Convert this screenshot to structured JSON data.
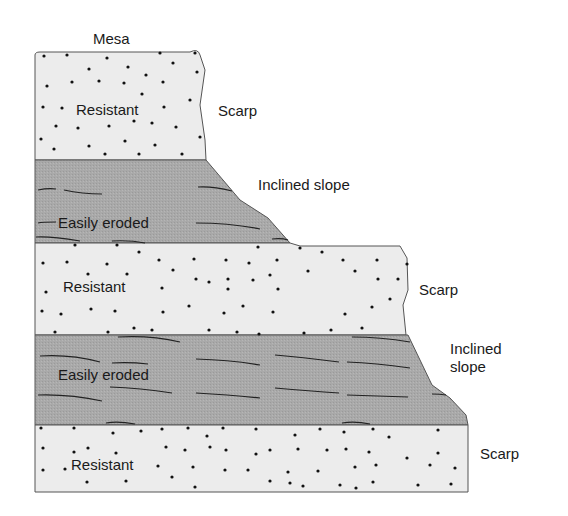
{
  "diagram": {
    "title_label": "Mesa",
    "layers": [
      {
        "type": "resistant",
        "label": "Resistant",
        "side_label": "Scarp"
      },
      {
        "type": "easily-eroded",
        "label": "Easily eroded",
        "side_label": "Inclined slope"
      },
      {
        "type": "resistant",
        "label": "Resistant",
        "side_label": "Scarp"
      },
      {
        "type": "easily-eroded",
        "label": "Easily eroded",
        "side_label_line1": "Inclined",
        "side_label_line2": "slope"
      },
      {
        "type": "resistant",
        "label": "Resistant",
        "side_label": "Scarp"
      }
    ],
    "colors": {
      "resistant_fill": "#ececec",
      "eroded_fill": "#a9a9a9",
      "outline": "#555555",
      "dot": "#111111",
      "bedding_line": "#222222"
    }
  }
}
